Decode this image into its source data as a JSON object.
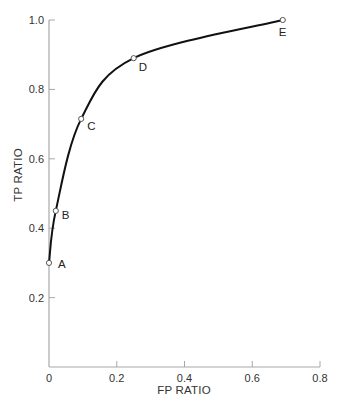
{
  "chart_data": {
    "type": "line",
    "title": "",
    "xlabel": "FP RATIO",
    "ylabel": "TP RATIO",
    "xlim": [
      0,
      0.8
    ],
    "ylim": [
      0,
      1.0
    ],
    "grid": false,
    "legend": null,
    "x_ticks": [
      "0",
      "0.2",
      "0.4",
      "0.6",
      "0.8"
    ],
    "y_ticks": [
      "0.2",
      "0.4",
      "0.6",
      "0.8",
      "1.0"
    ],
    "series": [
      {
        "name": "ROC curve",
        "points": [
          {
            "label": "A",
            "x": 0.0,
            "y": 0.3
          },
          {
            "label": "B",
            "x": 0.02,
            "y": 0.45
          },
          {
            "label": "C",
            "x": 0.095,
            "y": 0.715
          },
          {
            "label": "D",
            "x": 0.25,
            "y": 0.89
          },
          {
            "label": "E",
            "x": 0.69,
            "y": 1.0
          }
        ]
      }
    ],
    "colors": {
      "curve": "#111111",
      "axis": "#a8a8a8",
      "marker_fill": "#ffffff",
      "marker_stroke": "#555555"
    }
  }
}
